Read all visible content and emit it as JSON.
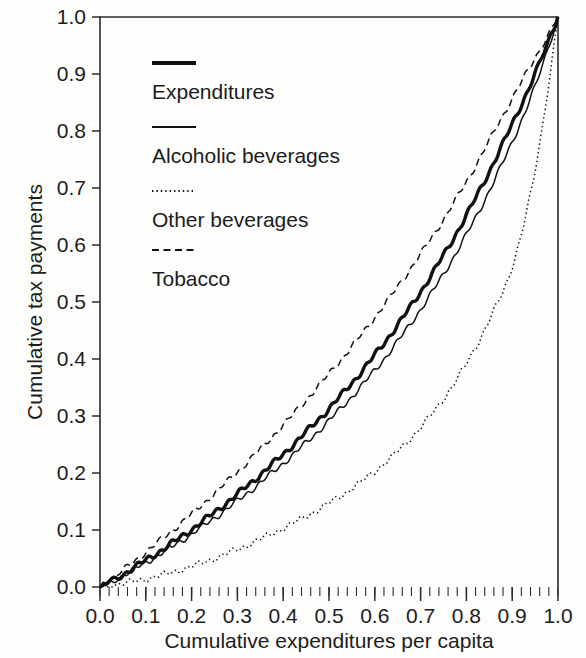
{
  "chart_data": {
    "type": "line",
    "title": "",
    "xlabel": "Cumulative expenditures per capita",
    "ylabel": "Cumulative tax payments",
    "xlim": [
      0.0,
      1.0
    ],
    "ylim": [
      0.0,
      1.0
    ],
    "grid": false,
    "legend_position": "upper-left-inside",
    "xticks": [
      "0.0",
      "0.1",
      "0.2",
      "0.3",
      "0.4",
      "0.5",
      "0.6",
      "0.7",
      "0.8",
      "0.9",
      "1.0"
    ],
    "yticks": [
      "0.0",
      "0.1",
      "0.2",
      "0.3",
      "0.4",
      "0.5",
      "0.6",
      "0.7",
      "0.8",
      "0.9",
      "1.0"
    ],
    "xtick_values": [
      0.0,
      0.1,
      0.2,
      0.3,
      0.4,
      0.5,
      0.6,
      0.7,
      0.8,
      0.9,
      1.0
    ],
    "ytick_values": [
      0.0,
      0.1,
      0.2,
      0.3,
      0.4,
      0.5,
      0.6,
      0.7,
      0.8,
      0.9,
      1.0
    ],
    "x_minor_tick_step": 0.02,
    "x": [
      0.0,
      0.05,
      0.1,
      0.15,
      0.2,
      0.25,
      0.3,
      0.35,
      0.4,
      0.45,
      0.5,
      0.55,
      0.6,
      0.65,
      0.7,
      0.75,
      0.8,
      0.85,
      0.9,
      0.95,
      1.0
    ],
    "series": [
      {
        "name": "Expenditures",
        "style": "thick-solid",
        "values": [
          0.0,
          0.022,
          0.047,
          0.073,
          0.101,
          0.131,
          0.163,
          0.197,
          0.233,
          0.272,
          0.313,
          0.358,
          0.407,
          0.46,
          0.518,
          0.582,
          0.652,
          0.729,
          0.812,
          0.9,
          1.0
        ]
      },
      {
        "name": "Alcoholic beverages",
        "style": "thin-solid",
        "values": [
          0.0,
          0.02,
          0.043,
          0.067,
          0.093,
          0.121,
          0.151,
          0.183,
          0.217,
          0.253,
          0.292,
          0.334,
          0.38,
          0.431,
          0.487,
          0.549,
          0.618,
          0.695,
          0.781,
          0.878,
          1.0
        ]
      },
      {
        "name": "Other beverages",
        "style": "fine-dotted",
        "values": [
          0.0,
          0.006,
          0.014,
          0.024,
          0.036,
          0.05,
          0.066,
          0.084,
          0.103,
          0.124,
          0.147,
          0.173,
          0.203,
          0.238,
          0.28,
          0.33,
          0.392,
          0.468,
          0.562,
          0.73,
          1.0
        ]
      },
      {
        "name": "Tobacco",
        "style": "dashed",
        "values": [
          0.0,
          0.029,
          0.061,
          0.094,
          0.128,
          0.164,
          0.202,
          0.242,
          0.284,
          0.328,
          0.374,
          0.422,
          0.473,
          0.527,
          0.584,
          0.645,
          0.711,
          0.783,
          0.857,
          0.928,
          1.0
        ]
      }
    ],
    "legend": [
      {
        "label": "Expenditures",
        "style": "thick-solid"
      },
      {
        "label": "Alcoholic beverages",
        "style": "thin-solid"
      },
      {
        "label": "Other beverages",
        "style": "fine-dotted"
      },
      {
        "label": "Tobacco",
        "style": "dashed"
      }
    ]
  }
}
